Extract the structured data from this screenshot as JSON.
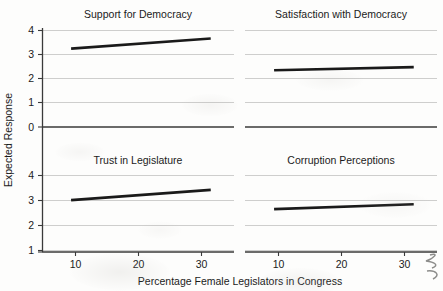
{
  "chart_data": {
    "type": "line",
    "title": "",
    "xlabel": "Percentage Female Legislators in Congress",
    "ylabel": "Expected Response",
    "xlim": [
      3,
      36
    ],
    "ylim": [
      0,
      4.3
    ],
    "xticks": [
      10,
      20,
      30
    ],
    "xticklabels": [
      "10",
      "20",
      "30"
    ],
    "yticks": [
      0,
      1,
      2,
      3,
      4
    ],
    "yticklabels": [
      "0",
      "1",
      "2",
      "3",
      "4"
    ],
    "grid": true,
    "grid_axis": "y",
    "legend": "none",
    "layout": "2x2 facet grid, shared x and y axes",
    "line_color": "#1a1a1a",
    "line_width": 2.6,
    "panels": [
      {
        "id": "support-for-democracy",
        "title": "Support for Democracy",
        "row": 0,
        "col": 0,
        "x": [
          8,
          32
        ],
        "values": [
          3.25,
          3.67
        ],
        "slope_per_point": 0.0175,
        "note": "Rising: expected response increases from about 3.25 at 8% to about 3.67 at 32%"
      },
      {
        "id": "satisfaction-with-democracy",
        "title": "Satisfaction with Democracy",
        "row": 0,
        "col": 1,
        "x": [
          8,
          32
        ],
        "values": [
          2.35,
          2.48
        ],
        "slope_per_point": 0.0054,
        "note": "Nearly flat, slight rise from about 2.35 to about 2.48"
      },
      {
        "id": "trust-in-legislature",
        "title": "Trust in Legislature",
        "row": 1,
        "col": 0,
        "x": [
          8,
          32
        ],
        "values": [
          2.71,
          3.25
        ],
        "slope_per_point": 0.0225,
        "note": "Rising from about 2.71 at 8% to about 3.25 at 32%"
      },
      {
        "id": "corruption-perceptions",
        "title": "Corruption Perceptions",
        "row": 1,
        "col": 1,
        "x": [
          8,
          32
        ],
        "values": [
          2.24,
          2.5
        ],
        "slope_per_point": 0.0108,
        "note": "Rising modestly from about 2.24 to about 2.50"
      }
    ]
  },
  "axes": {
    "ylabel": "Expected Response",
    "xlabel": "Percentage Female Legislators in Congress",
    "top_row_yticklabels": [
      "0",
      "1",
      "2",
      "3",
      "4"
    ],
    "bottom_row_yticklabels": [
      "0",
      "1",
      "2",
      "3",
      "4"
    ],
    "left_col_xticklabels": [
      "10",
      "20",
      "30"
    ],
    "right_col_xticklabels": [
      "10",
      "20",
      "30"
    ]
  },
  "annotations": {
    "scan_mark": "handwritten-pen-squiggle-bottom-right"
  }
}
